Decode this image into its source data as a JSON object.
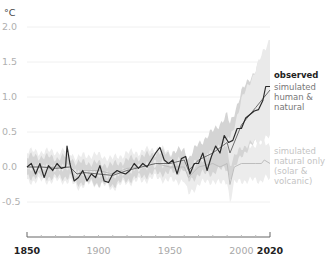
{
  "chart_data": {
    "type": "line",
    "title": "",
    "unit_label": "°C",
    "xlabel": "",
    "ylabel": "°C",
    "xlim": [
      1850,
      2020
    ],
    "ylim": [
      -0.9,
      2.0
    ],
    "y_ticks": [
      "2.0",
      "1.5",
      "1.0",
      "0.5",
      "0.0",
      "-0.5"
    ],
    "y_tick_values": [
      2.0,
      1.5,
      1.0,
      0.5,
      0.0,
      -0.5
    ],
    "x_ticks": [
      "1850",
      "1900",
      "1950",
      "2000",
      "2020"
    ],
    "x_tick_values": [
      1850,
      1900,
      1950,
      2000,
      2020
    ],
    "x_tick_bold": [
      true,
      false,
      false,
      false,
      true
    ],
    "grid": "horizontal, faint",
    "legend_position": "right, inline labels",
    "series": [
      {
        "name": "observed",
        "label": "observed",
        "color": "#2a2a2a",
        "x": [
          1850,
          1853,
          1856,
          1859,
          1862,
          1865,
          1868,
          1871,
          1874,
          1877,
          1878,
          1880,
          1883,
          1886,
          1889,
          1892,
          1895,
          1898,
          1901,
          1904,
          1907,
          1910,
          1913,
          1916,
          1919,
          1922,
          1925,
          1928,
          1931,
          1934,
          1937,
          1940,
          1943,
          1946,
          1949,
          1952,
          1955,
          1958,
          1961,
          1964,
          1967,
          1970,
          1973,
          1976,
          1979,
          1982,
          1985,
          1988,
          1991,
          1994,
          1997,
          2000,
          2003,
          2006,
          2009,
          2012,
          2015,
          2017,
          2020
        ],
        "values": [
          0.0,
          0.05,
          -0.1,
          0.05,
          -0.15,
          0.02,
          -0.05,
          0.05,
          -0.02,
          0.0,
          0.3,
          0.05,
          -0.2,
          -0.15,
          -0.05,
          -0.2,
          -0.1,
          -0.15,
          0.02,
          -0.2,
          -0.22,
          -0.1,
          -0.05,
          -0.08,
          -0.1,
          -0.05,
          0.05,
          -0.02,
          0.05,
          0.0,
          0.1,
          0.2,
          0.28,
          0.1,
          0.05,
          0.1,
          -0.1,
          0.12,
          0.15,
          -0.1,
          0.05,
          0.05,
          0.2,
          -0.05,
          0.15,
          0.3,
          0.2,
          0.45,
          0.35,
          0.38,
          0.55,
          0.55,
          0.7,
          0.75,
          0.8,
          0.82,
          0.95,
          1.15,
          1.15
        ]
      },
      {
        "name": "simulated human & natural",
        "label": "simulated human & natural",
        "color": "#6e6e6e",
        "x": [
          1850,
          1860,
          1870,
          1880,
          1885,
          1890,
          1900,
          1910,
          1920,
          1930,
          1940,
          1950,
          1960,
          1963,
          1970,
          1980,
          1990,
          1992,
          2000,
          2010,
          2020
        ],
        "values": [
          0.0,
          0.0,
          -0.02,
          0.0,
          -0.1,
          -0.08,
          -0.1,
          -0.12,
          -0.05,
          0.0,
          0.05,
          0.05,
          0.1,
          -0.05,
          0.1,
          0.2,
          0.35,
          0.2,
          0.6,
          0.85,
          1.1
        ]
      },
      {
        "name": "simulated natural only (solar & volcanic)",
        "label": "simulated natural only (solar & volcanic)",
        "color": "#bdbdbd",
        "x": [
          1850,
          1860,
          1870,
          1880,
          1885,
          1890,
          1900,
          1910,
          1920,
          1930,
          1940,
          1950,
          1960,
          1963,
          1970,
          1980,
          1985,
          1990,
          1992,
          1995,
          2000,
          2010,
          2014,
          2016,
          2020
        ],
        "values": [
          0.0,
          0.0,
          0.0,
          0.0,
          -0.1,
          -0.05,
          -0.05,
          -0.1,
          -0.02,
          0.0,
          0.05,
          0.0,
          0.0,
          -0.15,
          0.0,
          0.05,
          0.0,
          0.05,
          -0.25,
          0.0,
          0.05,
          0.05,
          0.05,
          0.1,
          0.05
        ]
      }
    ],
    "uncertainty_bands": [
      {
        "series": "simulated human & natural",
        "color": "#d2d2d2",
        "approx_range_2020": [
          0.75,
          1.8
        ]
      },
      {
        "series": "simulated natural only",
        "color": "#e9e9e9",
        "approx_range_2020": [
          -0.25,
          0.35
        ]
      }
    ]
  },
  "labels": {
    "unit": "°C",
    "observed": "observed",
    "human_natural": "simulated human & natural",
    "natural_only": "simulated natural only (solar & volcanic)"
  }
}
